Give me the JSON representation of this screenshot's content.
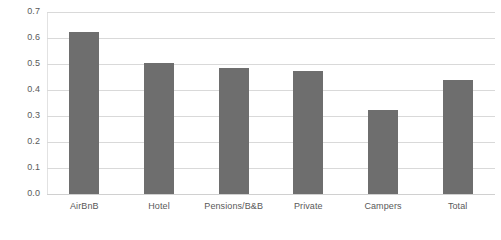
{
  "chart_data": {
    "type": "bar",
    "title": "",
    "subtitle": "",
    "xlabel": "",
    "ylabel": "",
    "categories": [
      "AirBnB",
      "Hotel",
      "Pensions/B&B",
      "Private",
      "Campers",
      "Total"
    ],
    "values": [
      0.625,
      0.505,
      0.483,
      0.473,
      0.322,
      0.44
    ],
    "series": [
      {
        "name": "",
        "values": [
          0.625,
          0.505,
          0.483,
          0.473,
          0.322,
          0.44
        ]
      }
    ],
    "ylim": [
      0.0,
      0.7
    ],
    "ytick_labels": [
      "0.7",
      "0.6",
      "0.5",
      "0.4",
      "0.3",
      "0.2",
      "0.1",
      "0.0"
    ],
    "ytick_values": [
      0.7,
      0.6,
      0.5,
      0.4,
      0.3,
      0.2,
      0.1,
      0.0
    ],
    "ytick_step": 0.1,
    "grid": true,
    "grid_axis": "y",
    "legend": false,
    "legend_position": "none",
    "bar_color": "#6e6e6e",
    "gridline_color": "#d9d9d9",
    "text_color": "#595959",
    "background_color": "#ffffff"
  }
}
